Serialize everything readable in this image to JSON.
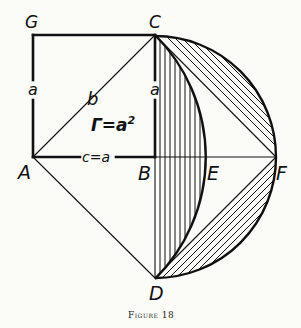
{
  "figure": {
    "caption": "Figure 18",
    "colors": {
      "ink": "#111111",
      "background": "#fbfbf8"
    },
    "points": {
      "G": {
        "label": "G",
        "x": 33,
        "y": 35
      },
      "C": {
        "label": "C",
        "x": 155,
        "y": 35
      },
      "A": {
        "label": "A",
        "x": 33,
        "y": 157
      },
      "B": {
        "label": "B",
        "x": 155,
        "y": 157
      },
      "E": {
        "label": "E",
        "x": 204,
        "y": 157
      },
      "F": {
        "label": "F",
        "x": 276,
        "y": 157
      },
      "D": {
        "label": "D",
        "x": 155,
        "y": 278
      }
    },
    "labels": {
      "side_ag": "a",
      "side_bc": "a",
      "diagonal_ac": "b",
      "side_ab": "c=a",
      "area": "Γ=a",
      "area_exp": "2"
    }
  }
}
